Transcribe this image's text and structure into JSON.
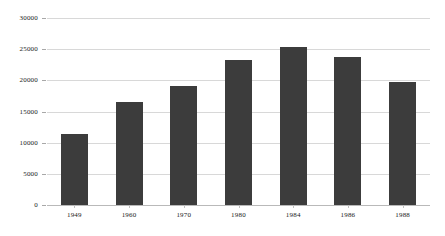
{
  "chart_data": {
    "type": "bar",
    "title": "",
    "subtitle": "",
    "xlabel": "",
    "ylabel": "",
    "categories": [
      "1949",
      "1960",
      "1970",
      "1980",
      "1984",
      "1986",
      "1988"
    ],
    "values": [
      11400,
      16600,
      19100,
      23200,
      25400,
      23700,
      19800
    ],
    "ylim": [
      0,
      30000
    ],
    "ytick_labels": [
      "0",
      "5000",
      "10000",
      "15000",
      "20000",
      "25000",
      "30000"
    ],
    "ytick_values": [
      0,
      5000,
      10000,
      15000,
      20000,
      25000,
      30000
    ],
    "grid": true,
    "legend": false,
    "legend_position": "none",
    "bar_color": "#3c3c3c",
    "gridline_color": "#d8d8d8",
    "background_color": "#ffffff",
    "axis_color": "#b9b9b9"
  }
}
